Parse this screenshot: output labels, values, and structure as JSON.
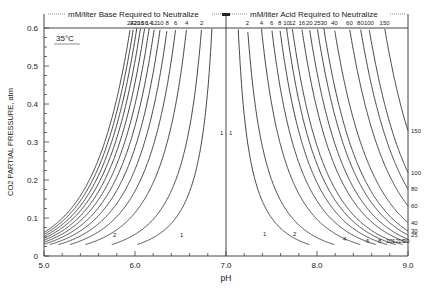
{
  "chart_data": {
    "type": "line",
    "title": "",
    "xlabel": "pH",
    "ylabel": "CO2 PARTIAL PRESSURE, atm",
    "xlim": [
      5.0,
      9.0
    ],
    "ylim": [
      0,
      0.6
    ],
    "x_ticks": [
      "5.0",
      "6.0",
      "7.0",
      "8.0",
      "9.0"
    ],
    "y_ticks": [
      "0",
      "0.1",
      "0.2",
      "0.3",
      "0.4",
      "0.5",
      "0.6"
    ],
    "annotation_temperature": "35°C",
    "top_label_base": "mM/liter Base Required to Neutralize",
    "top_label_acid": "mM/liter Acid Required to Neutralize",
    "base_series": {
      "name": "mM/liter Base Required to Neutralize",
      "values": [
        1,
        2,
        4,
        6,
        8,
        10,
        12,
        14,
        16,
        18,
        20,
        22,
        24
      ],
      "top_labels": [
        "24",
        "22",
        "20",
        "18",
        "16",
        "14",
        "12",
        "10",
        "8",
        "6",
        "4",
        "2"
      ]
    },
    "acid_series": {
      "name": "mM/liter Acid Required to Neutralize",
      "values": [
        1,
        2,
        4,
        6,
        8,
        10,
        12,
        16,
        20,
        25,
        30,
        40,
        60,
        80,
        100,
        150
      ],
      "top_labels": [
        "2",
        "4",
        "6",
        "8",
        "10",
        "12",
        "16",
        "20",
        "25",
        "30",
        "40",
        "60",
        "80",
        "100",
        "150"
      ],
      "right_labels": [
        "150",
        "100",
        "80",
        "60",
        "40",
        "30",
        "25"
      ],
      "bottom_labels": [
        "1",
        "2",
        "4",
        "6",
        "8",
        "10",
        "12",
        "16",
        "20"
      ]
    },
    "bottom_left_labels": [
      "2",
      "1"
    ],
    "center_labels": [
      "1",
      "1"
    ],
    "grid": false,
    "legend": "none"
  }
}
